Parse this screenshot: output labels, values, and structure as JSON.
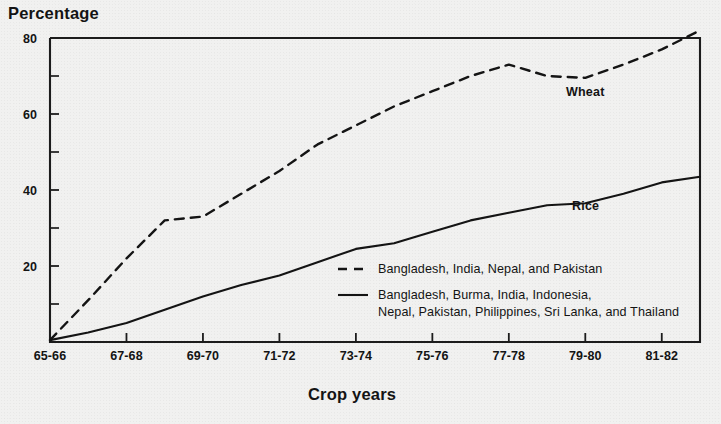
{
  "chart_data": {
    "type": "line",
    "title": "",
    "ylabel": "Percentage",
    "xlabel": "Crop years",
    "ylim": [
      0,
      80
    ],
    "y_ticks_major": [
      0,
      20,
      40,
      60,
      80
    ],
    "y_tick_labels": [
      "",
      "20",
      "40",
      "60",
      "80"
    ],
    "y_ticks_minor": [
      10,
      30,
      50,
      70
    ],
    "grid": false,
    "legend_position": "inside-lower-center",
    "categories": [
      "65-66",
      "66-67",
      "67-68",
      "68-69",
      "69-70",
      "70-71",
      "71-72",
      "72-73",
      "73-74",
      "74-75",
      "75-76",
      "76-77",
      "77-78",
      "78-79",
      "79-80",
      "80-81",
      "81-82",
      "82-83"
    ],
    "x_tick_labels": [
      "65-66",
      "67-68",
      "69-70",
      "71-72",
      "73-74",
      "75-76",
      "77-78",
      "79-80",
      "81-82"
    ],
    "x_tick_categories": [
      "65-66",
      "67-68",
      "69-70",
      "71-72",
      "73-74",
      "75-76",
      "77-78",
      "79-80",
      "81-82"
    ],
    "series": [
      {
        "name": "Wheat",
        "style": "dashed",
        "inline_label": "Wheat",
        "legend": "Bangladesh, India, Nepal, and Pakistan",
        "values": [
          0.5,
          11,
          22,
          32,
          33,
          39,
          45,
          52,
          57,
          62,
          66,
          70,
          73,
          70,
          69.5,
          73,
          77,
          82
        ]
      },
      {
        "name": "Rice",
        "style": "solid",
        "inline_label": "Rice",
        "legend": "Bangladesh, Burma, India, Indonesia, Nepal, Pakistan, Philippines, Sri Lanka, and Thailand",
        "values": [
          0.5,
          2.5,
          5,
          8.5,
          12,
          15,
          17.5,
          21,
          24.5,
          26,
          29,
          32,
          34,
          36,
          36.5,
          39,
          42,
          43.5
        ]
      }
    ]
  },
  "axis_titles": {
    "y": "Percentage",
    "x": "Crop years"
  },
  "series_labels": {
    "wheat": "Wheat",
    "rice": "Rice"
  },
  "legend": {
    "entries": [
      {
        "style": "dashed",
        "lines": [
          "Bangladesh, India, Nepal, and Pakistan"
        ]
      },
      {
        "style": "solid",
        "lines": [
          "Bangladesh, Burma, India, Indonesia,",
          "Nepal, Pakistan, Philippines, Sri Lanka,  and Thailand"
        ]
      }
    ]
  },
  "colors": {
    "ink": "#141414",
    "paper": "#f1f1f0"
  }
}
